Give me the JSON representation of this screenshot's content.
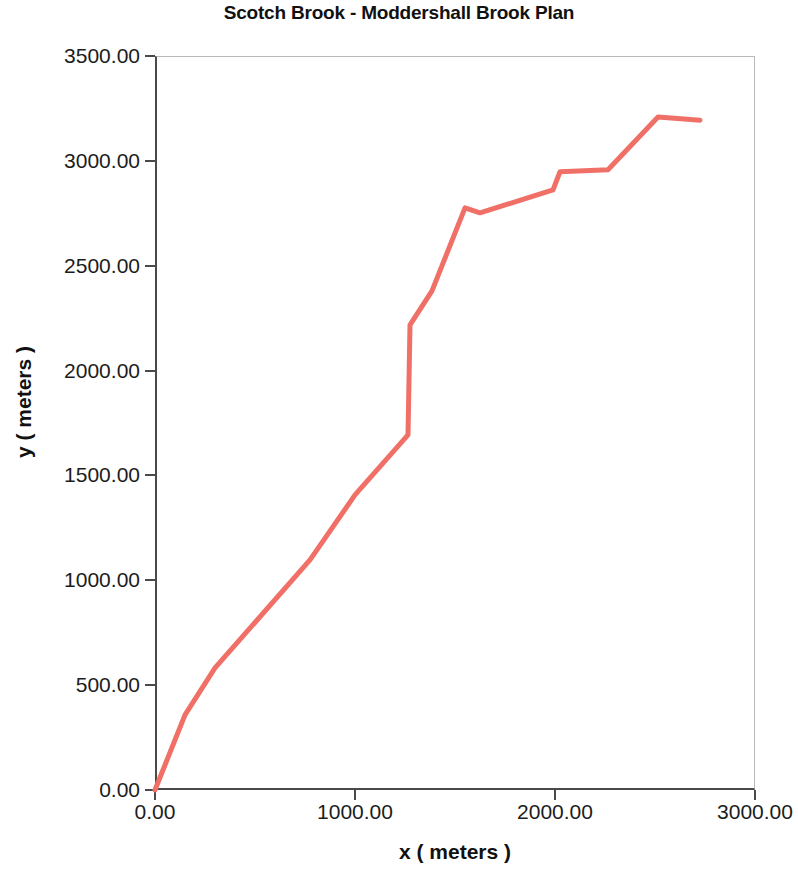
{
  "chart_data": {
    "type": "line",
    "title": "Scotch Brook - Moddershall Brook Plan",
    "xlabel": "x ( meters )",
    "ylabel": "y ( meters )",
    "xlim": [
      0,
      3000
    ],
    "ylim": [
      0,
      3500
    ],
    "grid": false,
    "legend": "none",
    "line_color": "#f07068",
    "line_width": 5,
    "xticks": [
      0,
      1000,
      2000,
      3000
    ],
    "xtick_labels": [
      "0.00",
      "1000.00",
      "2000.00",
      "3000.00"
    ],
    "yticks": [
      0,
      500,
      1000,
      1500,
      2000,
      2500,
      3000,
      3500
    ],
    "ytick_labels": [
      "0.00",
      "500.00",
      "1000.00",
      "1500.00",
      "2000.00",
      "2500.00",
      "3000.00",
      "3500.00"
    ],
    "series": [
      {
        "name": "Scotch Brook - Moddershall Brook",
        "x": [
          0,
          150,
          300,
          775,
          1000,
          1265,
          1275,
          1385,
          1550,
          1625,
          1990,
          2025,
          2265,
          2515,
          2725
        ],
        "y": [
          0,
          358,
          582,
          1097,
          1407,
          1693,
          2218,
          2380,
          2776,
          2752,
          2862,
          2948,
          2958,
          3209,
          3194
        ]
      }
    ]
  }
}
